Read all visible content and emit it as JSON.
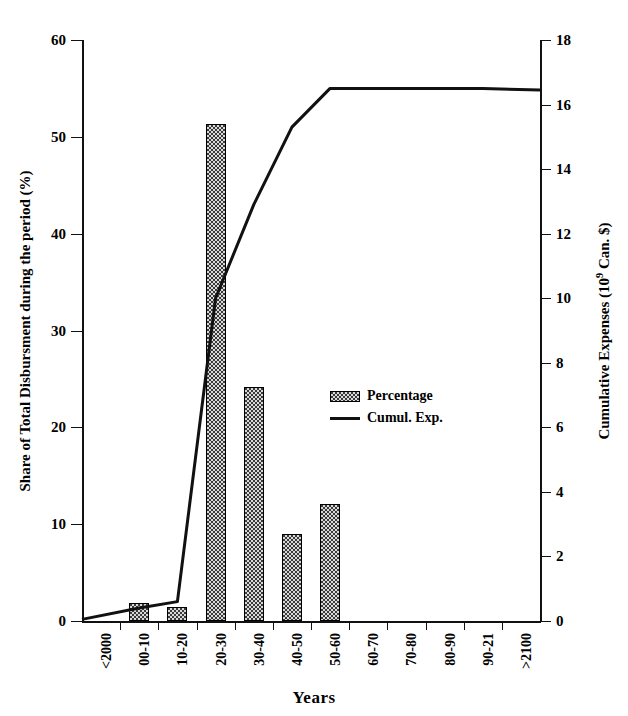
{
  "chart_data": {
    "type": "bar",
    "title": "",
    "xlabel": "Years",
    "ylabel": "Share of Total Disbursment during the period (%)",
    "y2label": "Cumulative Expenses (10⁹ Can. $)",
    "grid": false,
    "legend_position": "center",
    "categories": [
      "<2000",
      "00-10",
      "10-20",
      "20-30",
      "30-40",
      "40-50",
      "50-60",
      "60-70",
      "70-80",
      "80-90",
      "90-21",
      ">2100"
    ],
    "ylim": [
      0,
      60
    ],
    "yticks": [
      0,
      10,
      20,
      30,
      40,
      50,
      60
    ],
    "y2lim": [
      0,
      18
    ],
    "y2ticks": [
      0,
      2,
      4,
      6,
      8,
      10,
      12,
      14,
      16,
      18
    ],
    "series": [
      {
        "name": "Percentage",
        "kind": "bar",
        "axis": "left",
        "values": [
          0,
          1.9,
          1.4,
          51.3,
          24.2,
          9.0,
          12.1,
          0,
          0,
          0,
          0,
          0
        ]
      },
      {
        "name": "Cumul. Exp.",
        "kind": "line",
        "axis": "right",
        "values": [
          0.05,
          0.4,
          0.6,
          10.0,
          12.9,
          15.3,
          16.5,
          16.5,
          16.5,
          16.5,
          16.5,
          16.45
        ]
      }
    ]
  },
  "legend": {
    "entries": [
      {
        "label": "Percentage",
        "marker": "hatched-swatch"
      },
      {
        "label": "Cumul. Exp.",
        "marker": "solid-line"
      }
    ]
  },
  "colors": {
    "axis": "#111111",
    "bar_fill": "#3b3b3b",
    "bar_edge": "#000000",
    "line": "#111111",
    "background": "#ffffff"
  }
}
